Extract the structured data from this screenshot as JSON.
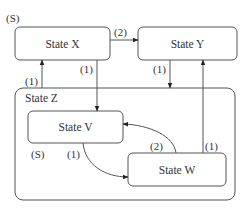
{
  "diagram": {
    "type": "state-machine",
    "states": {
      "x": {
        "label": "State X",
        "start_marker": "(S)"
      },
      "y": {
        "label": "State Y"
      },
      "z": {
        "label": "State Z",
        "composite": true
      },
      "v": {
        "label": "State V",
        "start_marker": "(S)"
      },
      "w": {
        "label": "State W"
      }
    },
    "transitions": {
      "x_to_y": {
        "from": "State X",
        "to": "State Y",
        "label": "(2)"
      },
      "x_to_v": {
        "from": "State X",
        "to": "State V",
        "label": "(1)"
      },
      "z_to_x": {
        "from": "State Z",
        "to": "State X",
        "label": "(1)"
      },
      "y_to_z": {
        "from": "State Y",
        "to": "State Z",
        "label": "(1)"
      },
      "w_to_y": {
        "from": "State W",
        "to": "State Y",
        "label": "(1)"
      },
      "v_to_w": {
        "from": "State V",
        "to": "State W",
        "label": "(1)"
      },
      "w_to_v": {
        "from": "State W",
        "to": "State V",
        "label": "(2)"
      }
    },
    "colors": {
      "stroke": "#555555",
      "text": "#333333",
      "background": "#ffffff"
    }
  }
}
